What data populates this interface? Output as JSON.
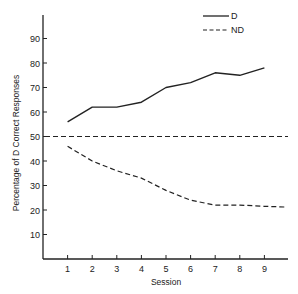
{
  "chart_data": {
    "type": "line",
    "title": "",
    "xlabel": "Session",
    "ylabel": "Percentage of D Correct Responses",
    "x": [
      1,
      2,
      3,
      4,
      5,
      6,
      7,
      8,
      9
    ],
    "x_ticks": [
      "1",
      "2",
      "3",
      "4",
      "5",
      "6",
      "7",
      "8",
      "9"
    ],
    "y_ticks": [
      "10",
      "20",
      "30",
      "40",
      "50",
      "60",
      "70",
      "80",
      "90"
    ],
    "ylim": [
      0,
      100
    ],
    "xlim": [
      0,
      10
    ],
    "grid": false,
    "legend_position": "top-right",
    "series": [
      {
        "name": "D",
        "style": "solid",
        "values": [
          56,
          62,
          62,
          64,
          70,
          72,
          76,
          75,
          78
        ]
      },
      {
        "name": "ND",
        "style": "dashed",
        "values": [
          46,
          40,
          36,
          33,
          28,
          24,
          22,
          22,
          21.5
        ]
      }
    ],
    "reference_lines": [
      {
        "y": 50,
        "style": "dashed",
        "label": ""
      }
    ]
  },
  "legend": {
    "items": [
      {
        "label": "D",
        "style": "solid"
      },
      {
        "label": "ND",
        "style": "dashed"
      }
    ]
  },
  "colors": {
    "line": "#222222",
    "axis": "#222222",
    "background": "#ffffff"
  }
}
